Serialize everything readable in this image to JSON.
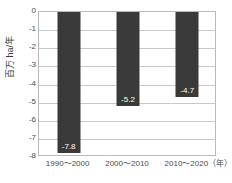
{
  "chart_data": {
    "type": "bar",
    "title": "",
    "subtitle": "",
    "xlabel": "",
    "ylabel": "百万 ha/年",
    "xunit": "（年）",
    "categories": [
      "1990～2000",
      "2000～2010",
      "2010～2020"
    ],
    "values": [
      -7.8,
      -5.2,
      -4.7
    ],
    "data_labels": [
      "-7.8",
      "-5.2",
      "-4.7"
    ],
    "ylim": [
      -8,
      0
    ],
    "yticks": [
      0,
      -1,
      -2,
      -3,
      -4,
      -5,
      -6,
      -7,
      -8
    ],
    "ytick_labels": [
      "0",
      "-1",
      "-2",
      "-3",
      "-4",
      "-5",
      "-6",
      "-7",
      "-8"
    ],
    "grid": true,
    "legend": null,
    "bar_color": "#3a3a3a",
    "grid_color": "#c8c8c8",
    "frame_color": "#b9b9b9",
    "label_text_color": "#ffffff",
    "axis_text_color": "#4a4a4a",
    "background": "#ffffff"
  }
}
